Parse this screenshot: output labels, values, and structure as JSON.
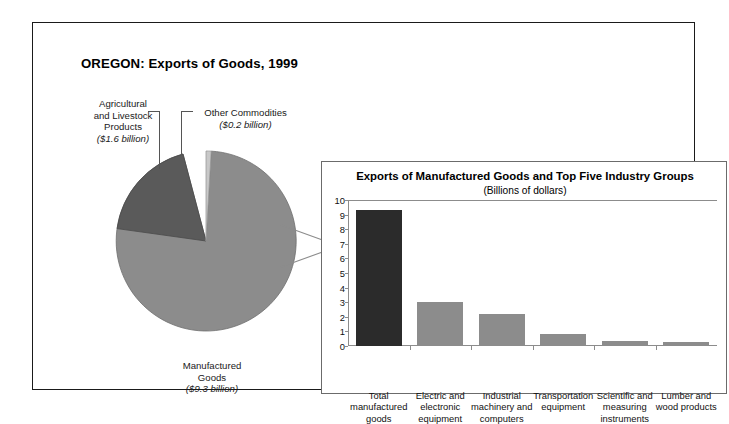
{
  "panel": {
    "title": "OREGON: Exports of Goods, 1999"
  },
  "pie_labels": {
    "agricultural": {
      "line1": "Agricultural",
      "line2": "and Livestock",
      "line3": "Products",
      "amount": "($1.6 billion)"
    },
    "other": {
      "line1": "Other Commodities",
      "amount": "($0.2 billion)"
    },
    "manufactured": {
      "line1": "Manufactured",
      "line2": "Goods",
      "amount": "($9.3 billion)"
    }
  },
  "inset": {
    "title": "Exports of Manufactured Goods and Top Five Industry Groups",
    "subtitle": "(Billions of dollars)"
  },
  "colors": {
    "manufactured_slice": "#8c8c8c",
    "agricultural_slice": "#5a5a5a",
    "other_slice": "#c8c8c8",
    "bar_highlight": "#2b2b2b",
    "bar_default": "#8c8c8c",
    "frame": "#1a1a1a",
    "axis": "#8c8c8c"
  },
  "chart_data": [
    {
      "type": "pie",
      "title": "OREGON: Exports of Goods, 1999",
      "unit": "billions of dollars",
      "labels": [
        "Manufactured Goods",
        "Agricultural and Livestock Products",
        "Other Commodities"
      ],
      "values": [
        9.3,
        1.6,
        0.2
      ],
      "value_labels": [
        "($9.3 billion)",
        "($1.6 billion)",
        "($0.2 billion)"
      ],
      "colors": [
        "#8c8c8c",
        "#5a5a5a",
        "#c8c8c8"
      ],
      "legend": "none (direct labels with leader lines)"
    },
    {
      "type": "bar",
      "title": "Exports of Manufactured Goods and Top Five Industry Groups",
      "subtitle": "(Billions of dollars)",
      "xlabel": "",
      "ylabel": "",
      "ylim": [
        0,
        10
      ],
      "yticks": [
        0,
        1,
        2,
        3,
        4,
        5,
        6,
        7,
        8,
        9,
        10
      ],
      "grid": false,
      "categories": [
        "Total manufactured goods",
        "Electric and electronic equipment",
        "Industrial machinery and computers",
        "Transportation equipment",
        "Scientific and measuring instruments",
        "Lumber and wood products"
      ],
      "category_lines": [
        [
          "Total",
          "manufactured",
          "goods"
        ],
        [
          "Electric and",
          "electronic",
          "equipment"
        ],
        [
          "Industrial",
          "machinery and",
          "computers"
        ],
        [
          "Transportation",
          "equipment"
        ],
        [
          "Scientific and",
          "measuring",
          "instruments"
        ],
        [
          "Lumber and",
          "wood products"
        ]
      ],
      "values": [
        9.3,
        3.0,
        2.2,
        0.85,
        0.35,
        0.3
      ],
      "bar_colors": [
        "#2b2b2b",
        "#8c8c8c",
        "#8c8c8c",
        "#8c8c8c",
        "#8c8c8c",
        "#8c8c8c"
      ]
    }
  ]
}
